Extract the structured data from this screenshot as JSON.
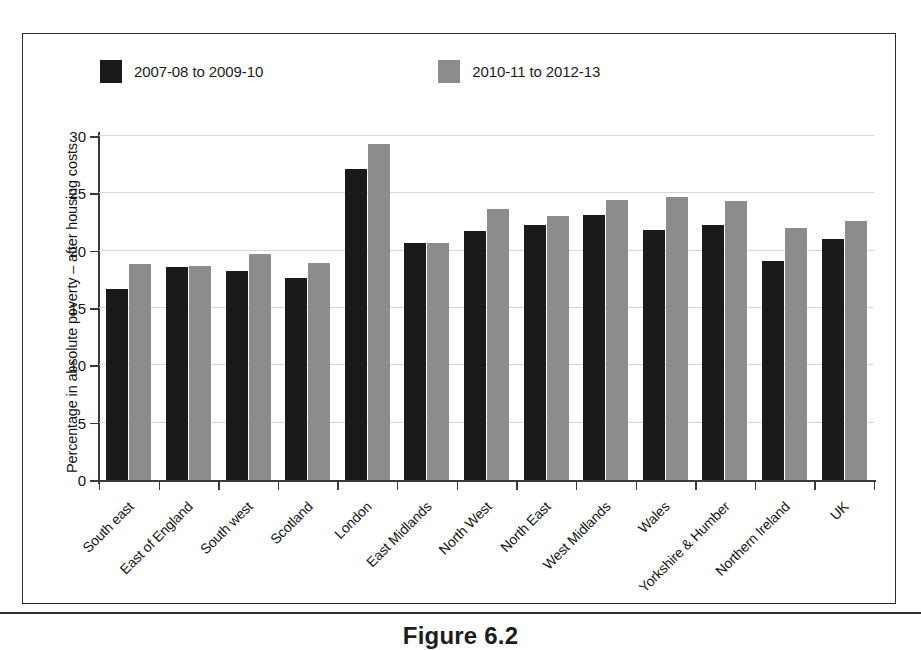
{
  "figure": {
    "caption": "Figure 6.2"
  },
  "chart_data": {
    "type": "bar",
    "title": "",
    "xlabel": "",
    "ylabel": "Percentage in absolute poverty – after housing costs",
    "ylim": [
      0,
      30
    ],
    "yticks": [
      0,
      5,
      10,
      15,
      20,
      25,
      30
    ],
    "ytick_labels": [
      "0",
      "5",
      "10",
      "15",
      "20",
      "25",
      "30"
    ],
    "grid": true,
    "legend_position": "top-left",
    "categories": [
      "South east",
      "East of England",
      "South west",
      "Scotland",
      "London",
      "East Midlands",
      "North West",
      "North East",
      "West Midlands",
      "Wales",
      "Yorkshire & Humber",
      "Northern Ireland",
      "UK"
    ],
    "series": [
      {
        "name": "2007-08 to 2009-10",
        "color": "#1a1a1a",
        "values": [
          16.7,
          18.6,
          18.2,
          17.6,
          27.1,
          20.7,
          21.7,
          22.2,
          23.1,
          21.8,
          22.2,
          19.1,
          21.0
        ]
      },
      {
        "name": "2010-11 to 2012-13",
        "color": "#8c8c8c",
        "values": [
          18.8,
          18.7,
          19.7,
          18.9,
          29.3,
          20.7,
          23.6,
          23.0,
          24.4,
          24.7,
          24.3,
          22.0,
          22.6
        ]
      }
    ]
  }
}
